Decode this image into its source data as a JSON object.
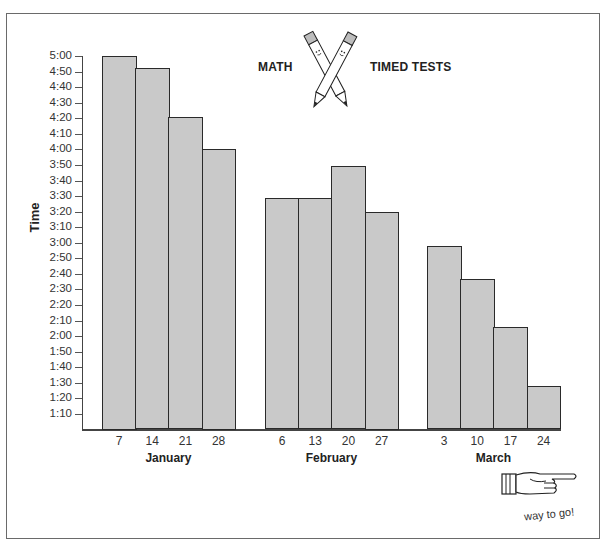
{
  "title": {
    "left_word": "MATH",
    "right_word": "TIMED TESTS",
    "illustration": "crossed-pencils-icon"
  },
  "footer": {
    "illustration": "pointing-hand-icon",
    "caption": "way to go!"
  },
  "colors": {
    "bar_fill": "#c9c9c9",
    "bar_border": "#2a2a2a",
    "frame": "#6a6a6a"
  },
  "chart_data": {
    "type": "bar",
    "xlabel": "",
    "ylabel": "Time",
    "ylim": [
      "1:00",
      "5:00"
    ],
    "ylim_seconds": [
      60,
      300
    ],
    "y_ticks": [
      "5:00",
      "4:50",
      "4:40",
      "4:30",
      "4:20",
      "4:10",
      "4:00",
      "3:50",
      "3:40",
      "3:30",
      "3:20",
      "3:10",
      "3:00",
      "2:50",
      "2:40",
      "2:30",
      "2:20",
      "2:10",
      "2:00",
      "1:50",
      "1:40",
      "1:30",
      "1:20",
      "1:10"
    ],
    "grid": false,
    "legend": null,
    "groups": [
      {
        "month": "January",
        "categories": [
          "7",
          "14",
          "21",
          "28"
        ],
        "values": [
          "5:00",
          "4:52",
          "4:21",
          "4:00"
        ],
        "values_seconds": [
          300,
          292,
          261,
          240
        ]
      },
      {
        "month": "February",
        "categories": [
          "6",
          "13",
          "20",
          "27"
        ],
        "values": [
          "3:29",
          "3:29",
          "3:49",
          "3:20"
        ],
        "values_seconds": [
          209,
          209,
          229,
          200
        ]
      },
      {
        "month": "March",
        "categories": [
          "3",
          "10",
          "17",
          "24"
        ],
        "values": [
          "2:58",
          "2:37",
          "2:06",
          "1:28"
        ],
        "values_seconds": [
          178,
          157,
          126,
          88
        ]
      }
    ]
  }
}
